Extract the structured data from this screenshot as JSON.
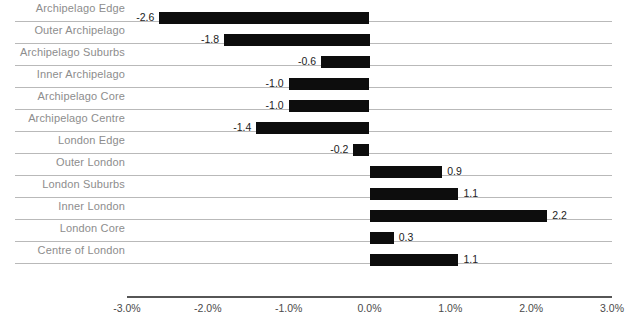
{
  "chart_data": {
    "type": "bar",
    "orientation": "horizontal",
    "title": "",
    "subtitle": "",
    "xlabel": "",
    "ylabel": "",
    "xlim": [
      -3.0,
      3.0
    ],
    "xtick_labels": [
      "-3.0%",
      "-2.0%",
      "-1.0%",
      "0.0%",
      "1.0%",
      "2.0%",
      "3.0%"
    ],
    "xticks": [
      -3.0,
      -2.0,
      -1.0,
      0.0,
      1.0,
      2.0,
      3.0
    ],
    "grid": true,
    "legend": false,
    "bar_color": "#0d0d0d",
    "gridline_color": "#b9b9b9",
    "axis_color": "#565656",
    "label_color": "#8d8d8d",
    "value_color": "#1c1c1c",
    "categories": [
      "Archipelago Edge",
      "Outer Archipelago",
      "Archipelago Suburbs",
      "Inner Archipelago",
      "Archipelago Core",
      "Archipelago Centre",
      "London Edge",
      "Outer London",
      "London Suburbs",
      "Inner London",
      "London Core",
      "Centre of London"
    ],
    "values": [
      -2.6,
      -1.8,
      -0.6,
      -1.0,
      -1.0,
      -1.4,
      -0.2,
      0.9,
      1.1,
      2.2,
      0.3,
      1.1
    ],
    "value_labels": [
      "-2.6",
      "-1.8",
      "-0.6",
      "-1.0",
      "-1.0",
      "-1.4",
      "-0.2",
      "0.9",
      "1.1",
      "2.2",
      "0.3",
      "1.1"
    ]
  }
}
